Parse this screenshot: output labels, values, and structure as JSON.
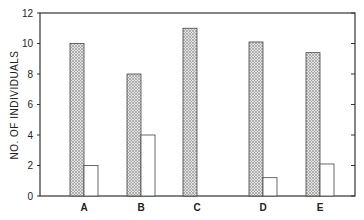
{
  "chart_data": {
    "type": "bar",
    "title": "",
    "xlabel": "",
    "ylabel": "NO. OF INDIVIDUALS",
    "categories": [
      "A",
      "B",
      "C",
      "D",
      "E"
    ],
    "series": [
      {
        "name": "stippled",
        "pattern": "dotted",
        "values": [
          10,
          8,
          11,
          10.1,
          9.4
        ]
      },
      {
        "name": "open",
        "pattern": "none",
        "values": [
          2,
          4,
          0,
          1.2,
          2.1
        ]
      }
    ],
    "ylim": [
      0,
      12
    ],
    "yticks": [
      0,
      2,
      4,
      6,
      8,
      10,
      12
    ],
    "grid": false,
    "legend": "none",
    "right_axis_ticks": true
  },
  "colors": {
    "axis": "#333333",
    "bar_stipple_fill": "#d8d8d8",
    "bar_stipple_dot": "#555555",
    "bar_open_fill": "#ffffff"
  }
}
